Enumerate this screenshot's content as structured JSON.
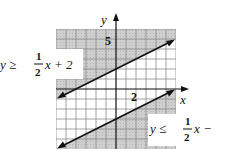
{
  "figure": {
    "type": "system-of-linear-inequalities-graph",
    "axes": {
      "x_label": "x",
      "y_label": "y",
      "x_range": [
        -6,
        6
      ],
      "y_range": [
        -6,
        6
      ],
      "grid": true,
      "grid_step": 1,
      "tick_labels": [
        {
          "axis": "y",
          "value": 5,
          "text": "5"
        },
        {
          "axis": "x",
          "value": 2,
          "text": "2"
        }
      ]
    },
    "inequalities": [
      {
        "id": "upper",
        "label_lhs": "y ≥",
        "label_num": "1",
        "label_den": "2",
        "label_rhs": "x + 2",
        "slope": 0.5,
        "intercept": 2,
        "relation": ">=",
        "shading": "above"
      },
      {
        "id": "lower",
        "label_lhs": "y ≤",
        "label_num": "1",
        "label_den": "2",
        "label_rhs": "x −",
        "slope": 0.5,
        "intercept": -3,
        "relation": "<=",
        "shading": "below"
      }
    ],
    "colors": {
      "shade": "#c8c8c8",
      "grid": "#8a8a8a",
      "line": "#111111",
      "background": "#ffffff"
    }
  }
}
